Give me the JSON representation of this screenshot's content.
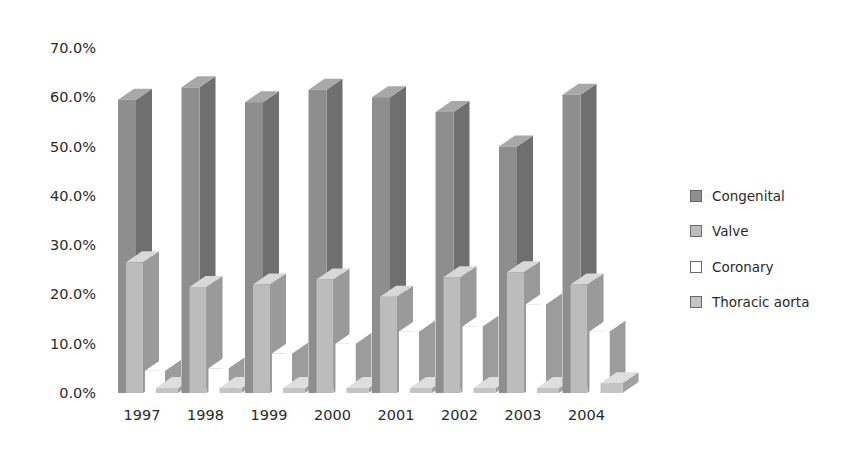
{
  "chart_data": {
    "type": "bar",
    "variant": "3d-clustered-column",
    "title": "",
    "xlabel": "",
    "ylabel": "",
    "categories": [
      "1997",
      "1998",
      "1999",
      "2000",
      "2001",
      "2002",
      "2003",
      "2004"
    ],
    "series": [
      {
        "name": "Congenital",
        "color": "#8e8e8e",
        "side": "#6f6f6f",
        "top": "#a8a8a8",
        "values": [
          59.5,
          62.0,
          59.0,
          61.5,
          60.0,
          57.0,
          50.0,
          60.5
        ]
      },
      {
        "name": "Valve",
        "color": "#bcbcbc",
        "side": "#9a9a9a",
        "top": "#d8d8d8",
        "values": [
          26.5,
          21.5,
          22.0,
          23.0,
          19.5,
          23.5,
          24.5,
          22.0
        ]
      },
      {
        "name": "Coronary",
        "color": "#ffffff",
        "side": "#9c9c9c",
        "top": "#ffffff",
        "values": [
          4.5,
          5.0,
          8.0,
          10.0,
          12.5,
          13.5,
          18.0,
          12.5
        ]
      },
      {
        "name": "Thoracic aorta",
        "color": "#c4c4c4",
        "side": "#a2a2a2",
        "top": "#dedede",
        "values": [
          1.0,
          1.0,
          1.0,
          1.0,
          1.0,
          1.0,
          1.0,
          2.0
        ]
      }
    ],
    "yticks": [
      "0.0%",
      "10.0%",
      "20.0%",
      "30.0%",
      "40.0%",
      "50.0%",
      "60.0%",
      "70.0%"
    ],
    "ylim": [
      0,
      70
    ],
    "grid": false,
    "legend_position": "right"
  },
  "legend": {
    "items": [
      {
        "label": "Congenital",
        "color": "#8e8e8e"
      },
      {
        "label": "Valve",
        "color": "#bcbcbc"
      },
      {
        "label": "Coronary",
        "color": "#ffffff"
      },
      {
        "label": "Thoracic aorta",
        "color": "#c4c4c4"
      }
    ]
  }
}
